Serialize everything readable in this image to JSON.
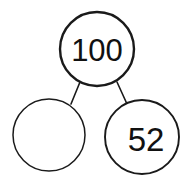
{
  "figure": {
    "type": "number-bond",
    "background_color": "#ffffff",
    "stroke_color": "#1a1a1a",
    "text_color": "#111111"
  },
  "nodes": {
    "total": {
      "label": "100",
      "role": "whole",
      "cx": 97,
      "cy": 49,
      "r": 37,
      "stroke_width": 2.4,
      "font_size": 31,
      "text_x": 97,
      "text_y": 50,
      "filled": true
    },
    "part_left": {
      "label": "",
      "role": "missing-part",
      "cx": 49,
      "cy": 135,
      "r": 36,
      "stroke_width": 1.5,
      "font_size": 31,
      "text_x": 49,
      "text_y": 136,
      "filled": false
    },
    "part_right": {
      "label": "52",
      "role": "known-part",
      "cx": 142,
      "cy": 137,
      "r": 37,
      "stroke_width": 1.9,
      "font_size": 33,
      "text_x": 146,
      "text_y": 139,
      "filled": true
    }
  },
  "connectors": [
    {
      "name": "total-to-left-part",
      "x1": 80,
      "y1": 82,
      "x2": 71,
      "y2": 104,
      "stroke_width": 1.6
    },
    {
      "name": "total-to-right-part",
      "x1": 117,
      "y1": 82,
      "x2": 127,
      "y2": 104,
      "stroke_width": 1.6
    }
  ]
}
